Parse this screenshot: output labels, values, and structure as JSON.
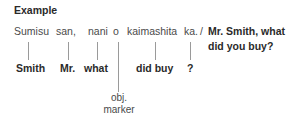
{
  "heading": "Example",
  "japanese_words": [
    {
      "text": "Sumisu",
      "x": 14,
      "line_x": 28
    },
    {
      "text": "san,",
      "x": 57,
      "line_x": 68
    },
    {
      "text": "nani",
      "x": 89,
      "line_x": 97
    },
    {
      "text": "o",
      "x": 113,
      "line_x": 117
    },
    {
      "text": "kaimashita",
      "x": 128,
      "line_x": 155
    },
    {
      "text": "ka.",
      "x": 185,
      "line_x": 190
    }
  ],
  "separator": "/",
  "translation": {
    "line1": "Mr. Smith, what",
    "line2": "did you buy?"
  },
  "glosses": [
    {
      "text": "Smith",
      "x": 16
    },
    {
      "text": "Mr.",
      "x": 60
    },
    {
      "text": "what",
      "x": 84
    },
    {
      "text": "did buy",
      "x": 136
    },
    {
      "text": "?",
      "x": 188
    }
  ],
  "particle_note": {
    "line1": "obj.",
    "line2": "marker"
  }
}
